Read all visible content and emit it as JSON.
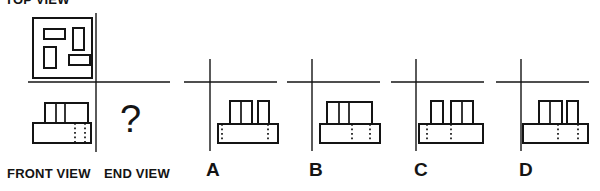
{
  "labels": {
    "top_view": "TOP VIEW",
    "front_view": "FRONT VIEW",
    "end_view": "END VIEW",
    "unknown": "?"
  },
  "options": [
    {
      "label": "A"
    },
    {
      "label": "B"
    },
    {
      "label": "C"
    },
    {
      "label": "D"
    }
  ],
  "colors": {
    "ink": "#141414",
    "background": "#ffffff"
  },
  "figures": [
    {
      "name": "top-view-figure",
      "shapes": [
        {
          "t": "rect",
          "x": 33,
          "y": 18,
          "w": 59,
          "h": 60,
          "n": "top-view-outline"
        },
        {
          "t": "rect",
          "x": 44,
          "y": 29,
          "w": 21,
          "h": 10,
          "n": "top-view-slot-1"
        },
        {
          "t": "rect",
          "x": 73,
          "y": 28,
          "w": 11,
          "h": 22,
          "n": "top-view-slot-2"
        },
        {
          "t": "rect",
          "x": 44,
          "y": 47,
          "w": 12,
          "h": 21,
          "n": "top-view-slot-3"
        },
        {
          "t": "rect",
          "x": 69,
          "y": 55,
          "w": 21,
          "h": 10,
          "n": "top-view-slot-4"
        }
      ]
    },
    {
      "name": "question-axes",
      "shapes": [
        {
          "t": "axis",
          "x1": 96,
          "y1": 13,
          "x2": 96,
          "y2": 152,
          "n": "vertical-axis"
        },
        {
          "t": "axis",
          "x1": 28,
          "y1": 82,
          "x2": 170,
          "y2": 82,
          "n": "horizontal-axis"
        }
      ]
    },
    {
      "name": "front-view-figure",
      "shapes": [
        {
          "t": "rect",
          "x": 33,
          "y": 123,
          "w": 58,
          "h": 20,
          "n": "front-base"
        },
        {
          "t": "rect",
          "x": 45,
          "y": 103,
          "w": 43,
          "h": 20,
          "n": "front-top-block"
        },
        {
          "t": "line",
          "x1": 56,
          "y1": 103,
          "x2": 56,
          "y2": 123,
          "n": "front-top-divider-1"
        },
        {
          "t": "line",
          "x1": 65,
          "y1": 103,
          "x2": 65,
          "y2": 123,
          "n": "front-top-divider-2"
        },
        {
          "t": "dline",
          "x1": 75,
          "y1": 123,
          "x2": 75,
          "y2": 143,
          "n": "front-hidden-edge-1"
        },
        {
          "t": "dline",
          "x1": 85,
          "y1": 123,
          "x2": 85,
          "y2": 143,
          "n": "front-hidden-edge-2"
        }
      ]
    },
    {
      "name": "option-a-figure",
      "shapes": [
        {
          "t": "axis",
          "x1": 210,
          "y1": 59,
          "x2": 210,
          "y2": 151,
          "n": "vertical-axis"
        },
        {
          "t": "axis",
          "x1": 184,
          "y1": 82,
          "x2": 277,
          "y2": 82,
          "n": "horizontal-axis"
        },
        {
          "t": "rect",
          "x": 218,
          "y": 124,
          "w": 60,
          "h": 19,
          "n": "base"
        },
        {
          "t": "rect",
          "x": 230,
          "y": 101,
          "w": 22,
          "h": 23,
          "n": "left-stud"
        },
        {
          "t": "line",
          "x1": 241,
          "y1": 101,
          "x2": 241,
          "y2": 124,
          "n": "stud-divider"
        },
        {
          "t": "rect",
          "x": 258,
          "y": 101,
          "w": 11,
          "h": 23,
          "n": "right-stud"
        },
        {
          "t": "dline",
          "x1": 222,
          "y1": 124,
          "x2": 222,
          "y2": 143,
          "n": "hidden-edge-1"
        },
        {
          "t": "dline",
          "x1": 268,
          "y1": 124,
          "x2": 268,
          "y2": 143,
          "n": "hidden-edge-2"
        }
      ]
    },
    {
      "name": "option-b-figure",
      "shapes": [
        {
          "t": "axis",
          "x1": 312,
          "y1": 59,
          "x2": 312,
          "y2": 151,
          "n": "vertical-axis"
        },
        {
          "t": "axis",
          "x1": 287,
          "y1": 82,
          "x2": 380,
          "y2": 82,
          "n": "horizontal-axis"
        },
        {
          "t": "rect",
          "x": 320,
          "y": 124,
          "w": 60,
          "h": 19,
          "n": "base"
        },
        {
          "t": "rect",
          "x": 327,
          "y": 102,
          "w": 45,
          "h": 22,
          "n": "top-block"
        },
        {
          "t": "line",
          "x1": 339,
          "y1": 102,
          "x2": 339,
          "y2": 124,
          "n": "top-divider-1"
        },
        {
          "t": "line",
          "x1": 349,
          "y1": 102,
          "x2": 349,
          "y2": 124,
          "n": "top-divider-2"
        },
        {
          "t": "dline",
          "x1": 352,
          "y1": 124,
          "x2": 352,
          "y2": 143,
          "n": "hidden-edge-1"
        },
        {
          "t": "dline",
          "x1": 370,
          "y1": 124,
          "x2": 370,
          "y2": 143,
          "n": "hidden-edge-2"
        }
      ]
    },
    {
      "name": "option-c-figure",
      "shapes": [
        {
          "t": "axis",
          "x1": 416,
          "y1": 59,
          "x2": 416,
          "y2": 151,
          "n": "vertical-axis"
        },
        {
          "t": "axis",
          "x1": 391,
          "y1": 82,
          "x2": 484,
          "y2": 82,
          "n": "horizontal-axis"
        },
        {
          "t": "rect",
          "x": 419,
          "y": 124,
          "w": 64,
          "h": 19,
          "n": "base"
        },
        {
          "t": "rect",
          "x": 431,
          "y": 101,
          "w": 12,
          "h": 23,
          "n": "left-stud"
        },
        {
          "t": "rect",
          "x": 451,
          "y": 101,
          "w": 22,
          "h": 23,
          "n": "right-stud"
        },
        {
          "t": "line",
          "x1": 462,
          "y1": 101,
          "x2": 462,
          "y2": 124,
          "n": "stud-divider"
        },
        {
          "t": "dline",
          "x1": 427,
          "y1": 124,
          "x2": 427,
          "y2": 143,
          "n": "hidden-edge-1"
        },
        {
          "t": "dline",
          "x1": 451,
          "y1": 124,
          "x2": 451,
          "y2": 143,
          "n": "hidden-edge-2"
        }
      ]
    },
    {
      "name": "option-d-figure",
      "shapes": [
        {
          "t": "axis",
          "x1": 521,
          "y1": 59,
          "x2": 521,
          "y2": 151,
          "n": "vertical-axis"
        },
        {
          "t": "axis",
          "x1": 496,
          "y1": 82,
          "x2": 589,
          "y2": 82,
          "n": "horizontal-axis"
        },
        {
          "t": "rect",
          "x": 523,
          "y": 124,
          "w": 65,
          "h": 19,
          "n": "base"
        },
        {
          "t": "rect",
          "x": 539,
          "y": 101,
          "w": 23,
          "h": 23,
          "n": "left-stud"
        },
        {
          "t": "line",
          "x1": 550,
          "y1": 101,
          "x2": 550,
          "y2": 124,
          "n": "stud-divider"
        },
        {
          "t": "rect",
          "x": 567,
          "y": 101,
          "w": 11,
          "h": 23,
          "n": "right-stud"
        },
        {
          "t": "dline",
          "x1": 558,
          "y1": 124,
          "x2": 558,
          "y2": 143,
          "n": "hidden-edge-1"
        },
        {
          "t": "dline",
          "x1": 578,
          "y1": 124,
          "x2": 578,
          "y2": 143,
          "n": "hidden-edge-2"
        }
      ]
    }
  ]
}
